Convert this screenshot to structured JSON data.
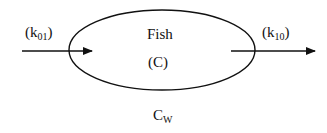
{
  "diagram": {
    "compartment": {
      "name": "Fish",
      "variable": "(C)"
    },
    "inflow": {
      "label_prefix": "(k",
      "label_sub": "01",
      "label_suffix": ")"
    },
    "outflow": {
      "label_prefix": "(k",
      "label_sub": "10",
      "label_suffix": ")"
    },
    "water": {
      "label_main": "C",
      "label_sub": "W"
    },
    "colors": {
      "stroke": "#111111",
      "background": "#ffffff"
    }
  }
}
